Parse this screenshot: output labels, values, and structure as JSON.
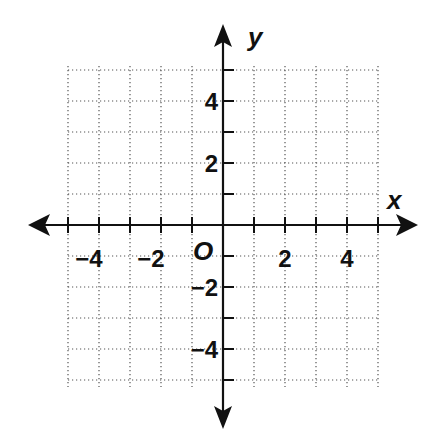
{
  "chart_data": {
    "type": "coordinate-grid",
    "title": "",
    "xlabel": "x",
    "ylabel": "y",
    "origin_label": "O",
    "xlim": [
      -5,
      5
    ],
    "ylim": [
      -5,
      5
    ],
    "grid": true,
    "grid_style": "dotted",
    "x_ticks": [
      -5,
      -4,
      -3,
      -2,
      -1,
      1,
      2,
      3,
      4,
      5
    ],
    "y_ticks": [
      -5,
      -4,
      -3,
      -2,
      -1,
      1,
      2,
      3,
      4,
      5
    ],
    "x_tick_labels": [
      {
        "value": -4,
        "label": "−4"
      },
      {
        "value": -2,
        "label": "−2"
      },
      {
        "value": 2,
        "label": "2"
      },
      {
        "value": 4,
        "label": "4"
      }
    ],
    "y_tick_labels": [
      {
        "value": 4,
        "label": "4"
      },
      {
        "value": 2,
        "label": "2"
      },
      {
        "value": -2,
        "label": "−2"
      },
      {
        "value": -4,
        "label": "−4"
      }
    ],
    "series": []
  }
}
